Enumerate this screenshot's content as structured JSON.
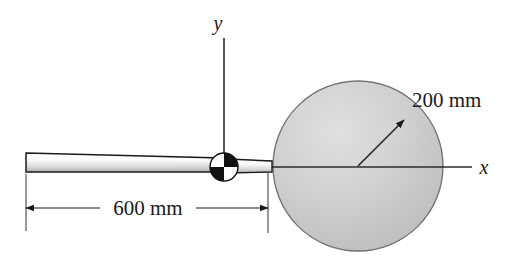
{
  "figure": {
    "background_color": "#ffffff",
    "width": 515,
    "height": 258
  },
  "axes": {
    "x_label": "x",
    "y_label": "y",
    "line_color": "#2b2b2b",
    "origin": {
      "x": 224,
      "y": 167
    },
    "x_end": {
      "x": 472,
      "y": 167
    },
    "y_end": {
      "x": 224,
      "y": 38
    }
  },
  "pivot": {
    "name": "pin-support",
    "center": {
      "x": 224,
      "y": 167
    },
    "radius": 14,
    "quadrant_fill_dark": "#111111",
    "quadrant_fill_light": "#ffffff"
  },
  "bar": {
    "name": "slender-bar",
    "left_end_x": 26,
    "right_end_x": 272,
    "fill_top": "#ffffff",
    "fill_bottom": "#b8b8b8",
    "outline_color": "#1a1a1a"
  },
  "disk": {
    "name": "circular-disk",
    "center": {
      "x": 358,
      "y": 166
    },
    "radius": 85,
    "fill": "#c9c9c9",
    "outline_color": "#6f6f6f"
  },
  "dimensions": [
    {
      "name": "bar-length",
      "label": "600 mm",
      "value": 600,
      "unit": "mm",
      "from_x": 26,
      "to_x": 268,
      "line_y": 208,
      "text_x": 147,
      "text_y": 214
    },
    {
      "name": "disk-radius",
      "label": "200 mm",
      "value": 200,
      "unit": "mm",
      "from": {
        "x": 358,
        "y": 166
      },
      "to": {
        "x": 406,
        "y": 119
      },
      "text_x": 415,
      "text_y": 107
    }
  ]
}
